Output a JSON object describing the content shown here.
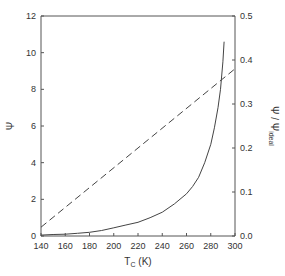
{
  "chart_data": {
    "type": "line",
    "title": "",
    "xlabel": "T_C (K)",
    "xlabel_main": "T",
    "xlabel_sub": "C",
    "xlabel_unit": " (K)",
    "ylabel": "Ψ",
    "y2label": "Ψ / Ψ_ideal",
    "y2label_main": "Ψ / Ψ",
    "y2label_sub": "ideal",
    "xlim": [
      140,
      300
    ],
    "ylim": [
      0,
      12
    ],
    "y2lim": [
      0.0,
      0.5
    ],
    "x_ticks": [
      "140",
      "160",
      "180",
      "200",
      "220",
      "240",
      "260",
      "280",
      "300"
    ],
    "y_ticks": [
      "0",
      "2",
      "4",
      "6",
      "8",
      "10",
      "12"
    ],
    "y2_ticks": [
      "0.0",
      "0.1",
      "0.2",
      "0.3",
      "0.4",
      "0.5"
    ],
    "grid": false,
    "legend": null,
    "series": [
      {
        "name": "Ψ",
        "axis": "left",
        "style": "solid",
        "x": [
          140,
          150,
          160,
          170,
          180,
          190,
          200,
          210,
          220,
          230,
          240,
          250,
          260,
          265,
          270,
          275,
          280,
          283,
          286,
          288,
          290,
          291
        ],
        "y": [
          0.05,
          0.08,
          0.1,
          0.15,
          0.2,
          0.3,
          0.45,
          0.6,
          0.75,
          1.0,
          1.3,
          1.75,
          2.3,
          2.7,
          3.2,
          4.0,
          5.0,
          5.9,
          7.0,
          8.0,
          9.5,
          10.6
        ]
      },
      {
        "name": "Ψ / Ψ_ideal",
        "axis": "right",
        "style": "dashed",
        "x": [
          140,
          300
        ],
        "y": [
          0.02,
          0.38
        ]
      }
    ]
  }
}
